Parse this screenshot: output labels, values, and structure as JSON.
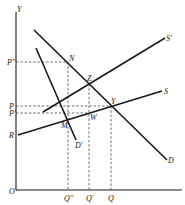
{
  "diagram": {
    "title": "",
    "axes": {
      "origin_label": "O",
      "y_label": "Y"
    },
    "curves": [
      {
        "id": "D",
        "label": "D",
        "type": "demand"
      },
      {
        "id": "D_prime",
        "label": "D'",
        "type": "demand"
      },
      {
        "id": "S",
        "label": "S",
        "type": "supply"
      },
      {
        "id": "S_prime",
        "label": "S'",
        "type": "supply"
      }
    ],
    "points": [
      {
        "id": "N",
        "label": "N"
      },
      {
        "id": "Z",
        "label": "Z"
      },
      {
        "id": "Y",
        "label": "Y"
      },
      {
        "id": "W",
        "label": "W"
      },
      {
        "id": "M",
        "label": "M"
      }
    ],
    "y_ticks": [
      {
        "id": "P_dblprime",
        "label": "P''"
      },
      {
        "id": "P",
        "label": "P"
      },
      {
        "id": "P_prime",
        "label": "P'"
      },
      {
        "id": "R",
        "label": "R"
      }
    ],
    "x_ticks": [
      {
        "id": "Q_dblprime",
        "label": "Q''"
      },
      {
        "id": "Q_prime",
        "label": "Q'"
      },
      {
        "id": "Q",
        "label": "Q"
      }
    ]
  }
}
